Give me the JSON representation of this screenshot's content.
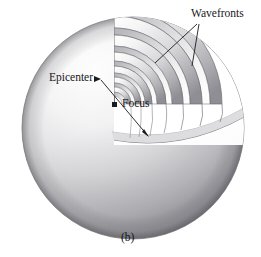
{
  "figure": {
    "panel_caption": "(b)",
    "background_color": "#ffffff",
    "ink_color": "#17161a"
  },
  "labels": {
    "wavefronts": "Wavefronts",
    "epicenter": "Epicenter",
    "focus": "Focus"
  },
  "diagram": {
    "sphere": {
      "name": "earth-sphere",
      "center_x": 133,
      "center_y": 128,
      "radius": 111,
      "fill_light": "#fdfdfd",
      "fill_mid": "#d2d2d4",
      "fill_dark": "#8d8d91",
      "edge_color": "#6f6f74"
    },
    "focus_marker": {
      "name": "focus-point",
      "x": 114,
      "y": 104,
      "size": 4,
      "color": "#1b1a1e"
    },
    "epicenter_marker": {
      "name": "epicenter-point",
      "x": 101,
      "y": 79,
      "color": "#1b1a1e"
    },
    "wavefront_shell_count": 7,
    "wavefront_radii": [
      14,
      25,
      38,
      53,
      70,
      88,
      107
    ],
    "shell_fill_light": "#fbfbfb",
    "shell_fill_shadow": "#9b9ba0",
    "shell_edge": "#5f5f64"
  },
  "leaders": {
    "wavefronts_lines": [
      {
        "name": "wavefronts-leader-1",
        "x1": 197,
        "y1": 24,
        "x2": 155,
        "y2": 63
      },
      {
        "name": "wavefronts-leader-2",
        "x1": 199,
        "y1": 24,
        "x2": 192,
        "y2": 66
      }
    ],
    "epicenter_line": {
      "name": "epicenter-leader",
      "x1": 101,
      "y1": 80,
      "x2": 148,
      "y2": 136
    },
    "focus_line": {
      "name": "focus-leader",
      "x1": 114,
      "y1": 104,
      "x2": 148,
      "y2": 136
    }
  }
}
